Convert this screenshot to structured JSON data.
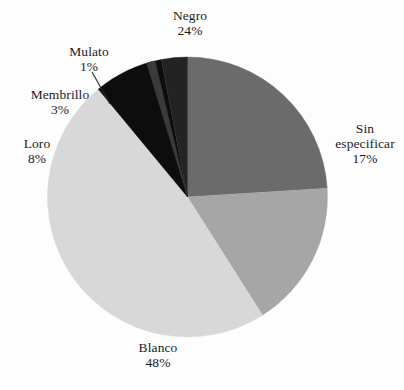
{
  "chart_data": {
    "type": "pie",
    "title": "",
    "subtitle": "",
    "xlabel": "",
    "ylabel": "",
    "legend_position": "none",
    "grid": false,
    "labels_show_percent": true,
    "categories": [
      "Negro",
      "Sin especificar",
      "Blanco",
      "Loro",
      "Membrillo",
      "Mulato"
    ],
    "values": [
      24,
      17,
      48,
      8,
      3,
      1
    ],
    "slices": [
      {
        "label": "Negro",
        "label_line1": "Negro",
        "label_line2": "",
        "value": 24,
        "percent": "24%",
        "color": "#6b6b6b",
        "start_deg": 0,
        "end_deg": 86.4,
        "leader": false
      },
      {
        "label": "Sin especificar",
        "label_line1": "Sin",
        "label_line2": "especificar",
        "value": 17,
        "percent": "17%",
        "color": "#a6a6a6",
        "start_deg": 86.4,
        "end_deg": 147.6,
        "leader": false
      },
      {
        "label": "Blanco",
        "label_line1": "Blanco",
        "label_line2": "",
        "value": 48,
        "percent": "48%",
        "color": "#d8d8d8",
        "start_deg": 147.6,
        "end_deg": 320.4,
        "leader": false
      },
      {
        "label": "Loro",
        "label_line1": "Loro",
        "label_line2": "",
        "value": 8,
        "percent": "8%",
        "color": "#0d0d0d",
        "start_deg": 320.4,
        "end_deg": 349.2,
        "leader": false
      },
      {
        "label": "Membrillo",
        "label_line1": "Membrillo",
        "label_line2": "",
        "value": 3,
        "percent": "3%",
        "color": "#232323",
        "start_deg": 349.2,
        "end_deg": 360.0,
        "leader": false
      },
      {
        "label": "Mulato",
        "label_line1": "Mulato",
        "label_line2": "",
        "value": 1,
        "percent": "1%",
        "color": "#3a3a3a",
        "start_deg": 343.0,
        "end_deg": 346.6,
        "leader": true
      }
    ]
  },
  "geometry": {
    "center_x": 187.5,
    "center_y": 197,
    "radius": 140
  },
  "labels": {
    "negro": {
      "name": "Negro",
      "value": "24%"
    },
    "sin": {
      "name": "Sin",
      "name2": "especificar",
      "value": "17%"
    },
    "blanco": {
      "name": "Blanco",
      "value": "48%"
    },
    "loro": {
      "name": "Loro",
      "value": "8%"
    },
    "membrillo": {
      "name": "Membrillo",
      "value": "3%"
    },
    "mulato": {
      "name": "Mulato",
      "value": "1%"
    }
  },
  "colors": {
    "background": "#fdfdfd",
    "text": "#1c1c1c",
    "leader_line": "#2a2a2a",
    "negro": "#6b6b6b",
    "sin_especificar": "#a6a6a6",
    "blanco": "#d8d8d8",
    "loro": "#0d0d0d",
    "membrillo": "#232323",
    "mulato": "#3a3a3a"
  }
}
